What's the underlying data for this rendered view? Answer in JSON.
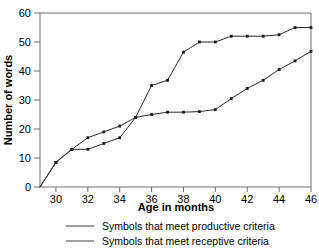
{
  "chart_data": {
    "type": "line",
    "title": "",
    "xlabel": "Age in months",
    "ylabel": "Number of words",
    "xlim": [
      29,
      46
    ],
    "ylim": [
      0,
      60
    ],
    "grid": false,
    "legend_position": "bottom",
    "xticks": [
      30,
      32,
      34,
      36,
      38,
      40,
      42,
      44,
      46
    ],
    "yticks": [
      0,
      10,
      20,
      30,
      40,
      50,
      60
    ],
    "x": [
      29,
      30,
      31,
      32,
      33,
      34,
      35,
      36,
      37,
      38,
      39,
      40,
      41,
      42,
      43,
      44,
      45,
      46
    ],
    "series": [
      {
        "name": "Symbols that meet productive criteria",
        "values": [
          0,
          8.5,
          13,
          13,
          15,
          17,
          24,
          25,
          25.8,
          25.8,
          26,
          26.7,
          30.5,
          34,
          36.8,
          40.5,
          43.5,
          46.8
        ]
      },
      {
        "name": "Symbols that meet receptive criteria",
        "values": [
          0,
          8.5,
          13,
          17,
          19,
          21,
          24,
          35,
          36.8,
          46.5,
          50,
          50,
          52,
          52,
          52,
          52.5,
          55,
          55
        ]
      }
    ]
  },
  "axes": {
    "x_title": "Age in months",
    "y_title": "Number of words"
  },
  "legend": {
    "items": [
      {
        "label": "Symbols that meet productive criteria"
      },
      {
        "label": "Symbols that meet receptive criteria"
      }
    ]
  }
}
